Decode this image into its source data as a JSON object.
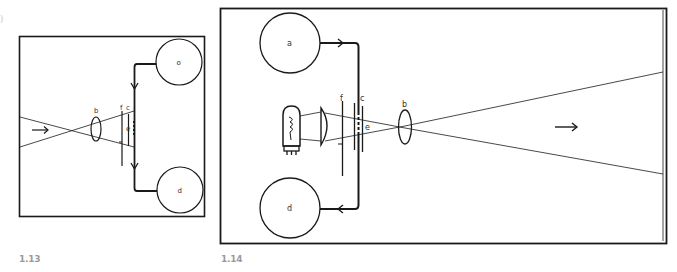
{
  "figures": [
    {
      "id": "fig-1-13",
      "caption": "1.13",
      "labels": {
        "supply_reel": "o",
        "takeup_reel": "d",
        "lens": "b",
        "plate_f": "f",
        "plate_c": "c",
        "gate": "e"
      },
      "direction_arrow": "→"
    },
    {
      "id": "fig-1-14",
      "caption": "1.14",
      "labels": {
        "supply_reel": "a",
        "takeup_reel": "d",
        "lens": "b",
        "plate_f": "f",
        "plate_c": "c",
        "gate": "e"
      },
      "direction_arrow": "→"
    }
  ],
  "stray_mark": ")",
  "colors": {
    "line": "#1a1a1a",
    "caption": "#9a9a9a",
    "background": "#ffffff"
  }
}
